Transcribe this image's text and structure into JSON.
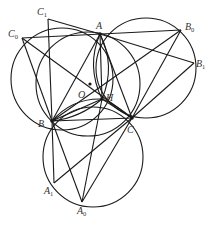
{
  "diagram": {
    "type": "geometry",
    "points": {
      "A": {
        "label": "A",
        "sub": "",
        "x": 100,
        "y": 34
      },
      "B": {
        "label": "B",
        "sub": "",
        "x": 52,
        "y": 121
      },
      "C": {
        "label": "C",
        "sub": "",
        "x": 132,
        "y": 118
      },
      "H": {
        "label": "H",
        "sub": "",
        "x": 102,
        "y": 99
      },
      "O": {
        "label": "O",
        "sub": "",
        "x": 90,
        "y": 85
      },
      "C0": {
        "label": "C",
        "sub": "0",
        "x": 22,
        "y": 38
      },
      "C1": {
        "label": "C",
        "sub": "1",
        "x": 48,
        "y": 19
      },
      "B0": {
        "label": "B",
        "sub": "0",
        "x": 181,
        "y": 30
      },
      "B1": {
        "label": "B",
        "sub": "1",
        "x": 194,
        "y": 63
      },
      "A1": {
        "label": "A",
        "sub": "1",
        "x": 54,
        "y": 183
      },
      "A0": {
        "label": "A",
        "sub": "0",
        "x": 82,
        "y": 202
      }
    },
    "labels": [
      "A",
      "B",
      "C",
      "H",
      "O",
      "C0",
      "C1",
      "B0",
      "B1",
      "A1",
      "A0"
    ],
    "stroke_color": "#1a1a1a",
    "label_color": "#333333"
  }
}
